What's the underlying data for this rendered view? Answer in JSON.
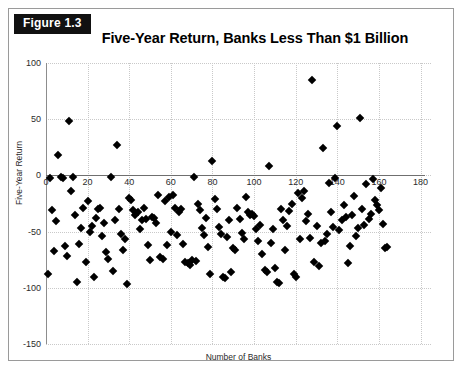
{
  "figure": {
    "badge_label": "Figure 1.3"
  },
  "chart_data": {
    "type": "scatter",
    "title": "Five-Year Return, Banks Less Than $1 Billion",
    "xlabel": "Number of Banks",
    "ylabel": "Five-Year Return",
    "xlim": [
      0,
      185
    ],
    "ylim": [
      -150,
      100
    ],
    "xticks": [
      0,
      20,
      40,
      60,
      80,
      100,
      120,
      140,
      160,
      180
    ],
    "yticks": [
      100,
      50,
      0,
      -50,
      -100,
      -150
    ],
    "grid": true,
    "legend": false,
    "marker": "diamond",
    "marker_color": "#000000",
    "points": [
      [
        1,
        -88
      ],
      [
        2,
        -2
      ],
      [
        3,
        -31
      ],
      [
        4,
        -67
      ],
      [
        5,
        -41
      ],
      [
        6,
        18
      ],
      [
        7,
        -1
      ],
      [
        8,
        -2
      ],
      [
        9,
        -63
      ],
      [
        10,
        -72
      ],
      [
        11,
        48
      ],
      [
        12,
        -14
      ],
      [
        13,
        -1
      ],
      [
        14,
        -35
      ],
      [
        15,
        -95
      ],
      [
        16,
        -61
      ],
      [
        17,
        -47
      ],
      [
        18,
        -29
      ],
      [
        19,
        -77
      ],
      [
        20,
        -23
      ],
      [
        21,
        -50
      ],
      [
        22,
        -45
      ],
      [
        23,
        -90
      ],
      [
        24,
        -38
      ],
      [
        25,
        -30
      ],
      [
        26,
        -29
      ],
      [
        27,
        -54
      ],
      [
        28,
        -42
      ],
      [
        29,
        -68
      ],
      [
        30,
        -74
      ],
      [
        31,
        -1
      ],
      [
        32,
        -85
      ],
      [
        33,
        -40
      ],
      [
        34,
        27
      ],
      [
        35,
        -30
      ],
      [
        36,
        -52
      ],
      [
        37,
        -66
      ],
      [
        38,
        -57
      ],
      [
        39,
        -97
      ],
      [
        40,
        -20
      ],
      [
        41,
        -22
      ],
      [
        42,
        -31
      ],
      [
        43,
        -35
      ],
      [
        44,
        -33
      ],
      [
        45,
        -48
      ],
      [
        46,
        -40
      ],
      [
        47,
        -29
      ],
      [
        48,
        -39
      ],
      [
        49,
        -62
      ],
      [
        50,
        -75
      ],
      [
        51,
        -37
      ],
      [
        52,
        -38
      ],
      [
        53,
        -42
      ],
      [
        54,
        -17
      ],
      [
        55,
        -73
      ],
      [
        56,
        -74
      ],
      [
        57,
        -23
      ],
      [
        58,
        -62
      ],
      [
        59,
        -19
      ],
      [
        60,
        -50
      ],
      [
        61,
        -17
      ],
      [
        62,
        -29
      ],
      [
        63,
        -53
      ],
      [
        64,
        -33
      ],
      [
        65,
        -30
      ],
      [
        66,
        -61
      ],
      [
        67,
        -77
      ],
      [
        68,
        -78
      ],
      [
        69,
        -80
      ],
      [
        70,
        -75
      ],
      [
        71,
        -1
      ],
      [
        72,
        -76
      ],
      [
        73,
        -25
      ],
      [
        74,
        -31
      ],
      [
        75,
        -47
      ],
      [
        76,
        -53
      ],
      [
        77,
        -38
      ],
      [
        78,
        -64
      ],
      [
        79,
        -88
      ],
      [
        80,
        13
      ],
      [
        81,
        -21
      ],
      [
        82,
        -30
      ],
      [
        83,
        -46
      ],
      [
        84,
        -52
      ],
      [
        85,
        -90
      ],
      [
        86,
        -91
      ],
      [
        87,
        -55
      ],
      [
        88,
        -40
      ],
      [
        89,
        -86
      ],
      [
        90,
        -65
      ],
      [
        91,
        -66
      ],
      [
        92,
        -29
      ],
      [
        93,
        -39
      ],
      [
        94,
        -51
      ],
      [
        95,
        -57
      ],
      [
        96,
        -19
      ],
      [
        97,
        -33
      ],
      [
        98,
        -35
      ],
      [
        99,
        -34
      ],
      [
        100,
        -36
      ],
      [
        101,
        -48
      ],
      [
        102,
        -58
      ],
      [
        103,
        -44
      ],
      [
        104,
        -70
      ],
      [
        105,
        -84
      ],
      [
        106,
        -86
      ],
      [
        107,
        8
      ],
      [
        108,
        -60
      ],
      [
        109,
        -48
      ],
      [
        110,
        -82
      ],
      [
        111,
        -95
      ],
      [
        112,
        -96
      ],
      [
        113,
        -30
      ],
      [
        114,
        -40
      ],
      [
        115,
        -66
      ],
      [
        116,
        -45
      ],
      [
        117,
        -32
      ],
      [
        118,
        -25
      ],
      [
        119,
        -88
      ],
      [
        120,
        -90
      ],
      [
        121,
        -16
      ],
      [
        122,
        -57
      ],
      [
        123,
        -20
      ],
      [
        124,
        -14
      ],
      [
        125,
        -41
      ],
      [
        126,
        -34
      ],
      [
        127,
        -56
      ],
      [
        128,
        85
      ],
      [
        129,
        -77
      ],
      [
        130,
        -45
      ],
      [
        131,
        -81
      ],
      [
        132,
        -60
      ],
      [
        133,
        24
      ],
      [
        134,
        -58
      ],
      [
        135,
        -52
      ],
      [
        136,
        -7
      ],
      [
        137,
        -33
      ],
      [
        138,
        -46
      ],
      [
        139,
        -2
      ],
      [
        140,
        44
      ],
      [
        141,
        -49
      ],
      [
        142,
        -40
      ],
      [
        143,
        -26
      ],
      [
        144,
        -37
      ],
      [
        145,
        -78
      ],
      [
        146,
        -63
      ],
      [
        147,
        -35
      ],
      [
        148,
        -18
      ],
      [
        149,
        -54
      ],
      [
        150,
        -47
      ],
      [
        151,
        51
      ],
      [
        152,
        -30
      ],
      [
        153,
        -44
      ],
      [
        154,
        -8
      ],
      [
        155,
        -39
      ],
      [
        156,
        -34
      ],
      [
        157,
        -3
      ],
      [
        158,
        -22
      ],
      [
        159,
        -26
      ],
      [
        160,
        -31
      ],
      [
        161,
        -11
      ],
      [
        162,
        -43
      ],
      [
        163,
        -65
      ],
      [
        164,
        -64
      ]
    ]
  }
}
